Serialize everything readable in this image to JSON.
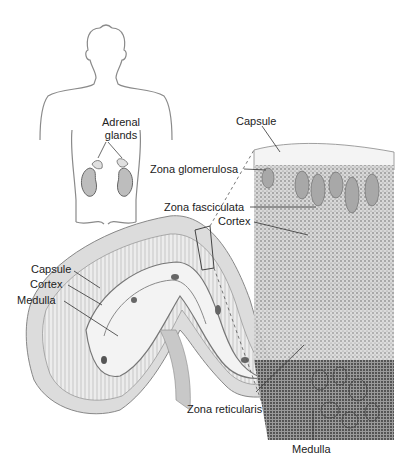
{
  "figure": {
    "labels": {
      "adrenal_glands_line1": "Adrenal",
      "adrenal_glands_line2": "glands",
      "capsule_top": "Capsule",
      "zona_glomerulosa": "Zona glomerulosa",
      "zona_fasciculata": "Zona fasciculata",
      "cortex_right": "Cortex",
      "capsule_left": "Capsule",
      "cortex_left": "Cortex",
      "medulla_left": "Medulla",
      "zona_reticularis": "Zona reticularis",
      "medulla_bottom": "Medulla"
    },
    "colors": {
      "line": "#555555",
      "tissue_light": "#e6e6e6",
      "tissue_mid": "#bdbdbd",
      "tissue_dark": "#7a7a7a"
    }
  }
}
